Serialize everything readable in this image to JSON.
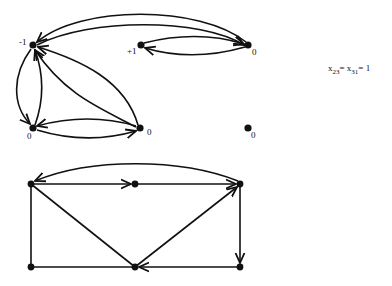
{
  "top_graph": {
    "nodes": [
      {
        "id": "n1",
        "label": "-1",
        "x": 33,
        "y": 45
      },
      {
        "id": "n2",
        "label": "+1",
        "x": 141,
        "y": 45
      },
      {
        "id": "n3",
        "label": "0",
        "x": 248,
        "y": 45
      },
      {
        "id": "n4",
        "label": "0",
        "x": 33,
        "y": 128
      },
      {
        "id": "n5",
        "label": "0",
        "x": 140,
        "y": 128
      },
      {
        "id": "n6",
        "label": "0",
        "x": 248,
        "y": 128
      }
    ],
    "edges": [
      {
        "from": "n3",
        "to": "n1",
        "kind": "curved-outer"
      },
      {
        "from": "n1",
        "to": "n3",
        "kind": "curved-inner"
      },
      {
        "from": "n2",
        "to": "n3",
        "kind": "curved-upper"
      },
      {
        "from": "n3",
        "to": "n2",
        "kind": "curved-lower"
      },
      {
        "from": "n1",
        "to": "n4",
        "kind": "curved-left"
      },
      {
        "from": "n4",
        "to": "n1",
        "kind": "curved-right"
      },
      {
        "from": "n5",
        "to": "n1",
        "kind": "curved-outer"
      },
      {
        "from": "n5",
        "to": "n1",
        "kind": "curved-inner"
      },
      {
        "from": "n5",
        "to": "n4",
        "kind": "curved-upper"
      },
      {
        "from": "n4",
        "to": "n5",
        "kind": "curved-lower"
      }
    ]
  },
  "equation": {
    "var1": "x",
    "sub1": "23",
    "eq1": "=",
    "var2": "x",
    "sub2": "31",
    "eq2": "=",
    "value": "1"
  },
  "bottom_graph": {
    "nodes": [
      {
        "id": "m1",
        "x": 31,
        "y": 184
      },
      {
        "id": "m2",
        "x": 135,
        "y": 184
      },
      {
        "id": "m3",
        "x": 240,
        "y": 184
      },
      {
        "id": "m4",
        "x": 31,
        "y": 267
      },
      {
        "id": "m5",
        "x": 135,
        "y": 267
      },
      {
        "id": "m6",
        "x": 240,
        "y": 267
      }
    ],
    "edges": [
      {
        "from": "m3",
        "to": "m1",
        "kind": "arc-top"
      },
      {
        "from": "m1",
        "to": "m2",
        "kind": "straight"
      },
      {
        "from": "m2",
        "to": "m3",
        "kind": "straight"
      },
      {
        "from": "m3",
        "to": "m6",
        "kind": "straight"
      },
      {
        "from": "m6",
        "to": "m5",
        "kind": "straight"
      },
      {
        "from": "m1",
        "to": "m5",
        "kind": "straight-undirected"
      },
      {
        "from": "m5",
        "to": "m3",
        "kind": "straight"
      },
      {
        "from": "m1",
        "to": "m4",
        "kind": "straight-undirected"
      },
      {
        "from": "m4",
        "to": "m5",
        "kind": "straight-undirected"
      }
    ]
  }
}
